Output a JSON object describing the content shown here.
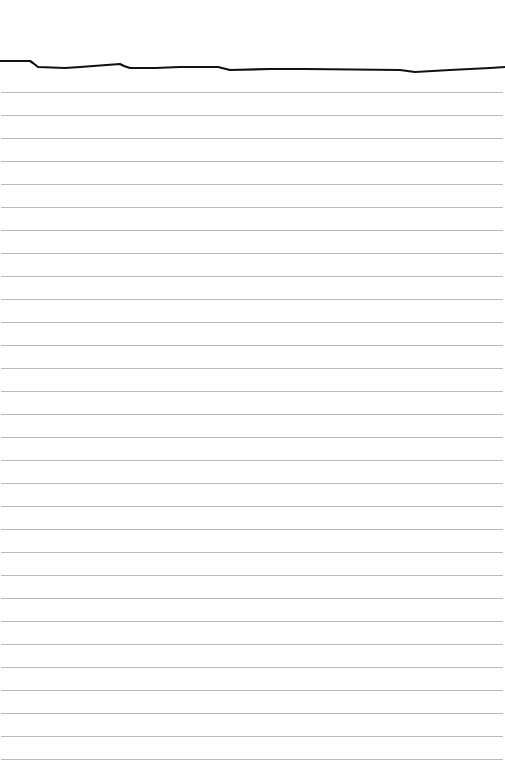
{
  "paper": {
    "background": "#ffffff",
    "rule_color": "#b9b9b9",
    "rule_count": 30,
    "rule_first_y": 92,
    "rule_spacing": 23
  },
  "ink_line": {
    "color": "#111111",
    "stroke_width": 2.2,
    "points": [
      [
        0,
        61
      ],
      [
        30,
        61
      ],
      [
        33,
        63
      ],
      [
        38,
        67
      ],
      [
        65,
        68
      ],
      [
        80,
        67
      ],
      [
        120,
        64
      ],
      [
        124,
        66
      ],
      [
        130,
        68
      ],
      [
        155,
        68
      ],
      [
        180,
        67
      ],
      [
        218,
        67
      ],
      [
        230,
        70
      ],
      [
        270,
        69
      ],
      [
        305,
        69
      ],
      [
        400,
        70
      ],
      [
        415,
        72
      ],
      [
        450,
        70
      ],
      [
        470,
        69
      ],
      [
        490,
        68
      ],
      [
        505,
        67
      ]
    ]
  }
}
